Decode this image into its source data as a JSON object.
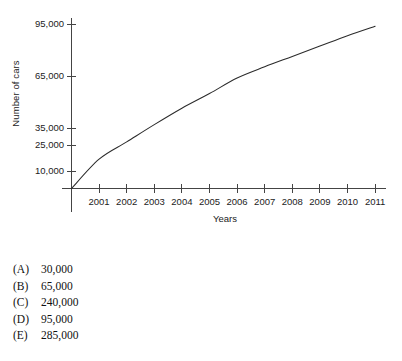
{
  "chart_data": {
    "type": "line",
    "title": "",
    "subtitle": "",
    "xlabel": "Years",
    "ylabel": "Number of cars",
    "grid": false,
    "legend": false,
    "legend_position": "none",
    "x": [
      2000,
      2001,
      2002,
      2003,
      2004,
      2005,
      2006,
      2007,
      2008,
      2009,
      2010,
      2011
    ],
    "xtick_labels": [
      "2001",
      "2002",
      "2003",
      "2004",
      "2005",
      "2006",
      "2007",
      "2008",
      "2009",
      "2010",
      "2011"
    ],
    "ytick_labels": [
      "95,000",
      "65,000",
      "35,000",
      "25,000",
      "10,000"
    ],
    "ytick_values": [
      95000,
      65000,
      35000,
      25000,
      10000
    ],
    "xlim": [
      2000,
      2011.5
    ],
    "ylim": [
      0,
      100000
    ],
    "series": [
      {
        "name": "Number of cars",
        "color": "#2b2b2b",
        "values": [
          0,
          17000,
          27000,
          37000,
          46500,
          55000,
          64000,
          70500,
          76500,
          82500,
          88500,
          94000
        ]
      }
    ],
    "annotations": []
  },
  "axes": {
    "y_label": "Number of cars",
    "x_label": "Years"
  },
  "question": {
    "options": [
      {
        "letter": "(A)",
        "value": "30,000"
      },
      {
        "letter": "(B)",
        "value": "65,000"
      },
      {
        "letter": "(C)",
        "value": "240,000"
      },
      {
        "letter": "(D)",
        "value": "95,000"
      },
      {
        "letter": "(E)",
        "value": "285,000"
      }
    ]
  },
  "colors": {
    "line": "#2b2b2b",
    "axis": "#444444",
    "text": "#1a1a1a",
    "background": "#ffffff"
  }
}
